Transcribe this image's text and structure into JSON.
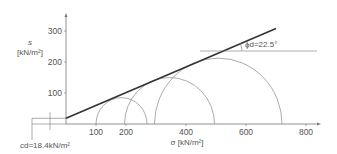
{
  "chart_data": {
    "type": "mohr_coulomb_diagram",
    "title": "",
    "xlabel": "σ [kN/m²]",
    "ylabel": "s",
    "ylabel_unit": "[kN/m²]",
    "x_ticks": [
      100,
      200,
      400,
      600,
      800
    ],
    "y_ticks": [
      100,
      200,
      300
    ],
    "xlim": [
      0,
      850
    ],
    "ylim": [
      0,
      340
    ],
    "failure_envelope": {
      "cohesion": 18.4,
      "friction_angle_deg": 22.5,
      "x_start": 0,
      "x_end": 700
    },
    "mohr_circles": [
      {
        "sigma3": 100,
        "sigma1": 270
      },
      {
        "sigma3": 195,
        "sigma1": 495
      },
      {
        "sigma3": 295,
        "sigma1": 720
      }
    ],
    "annotations": {
      "phi": "ϕd=22.5°",
      "cohesion": "cd=18.4kN/m²"
    },
    "grid": false
  },
  "colors": {
    "axis": "#777777",
    "envelope": "#333333",
    "circle": "#888888",
    "text": "#555555"
  }
}
